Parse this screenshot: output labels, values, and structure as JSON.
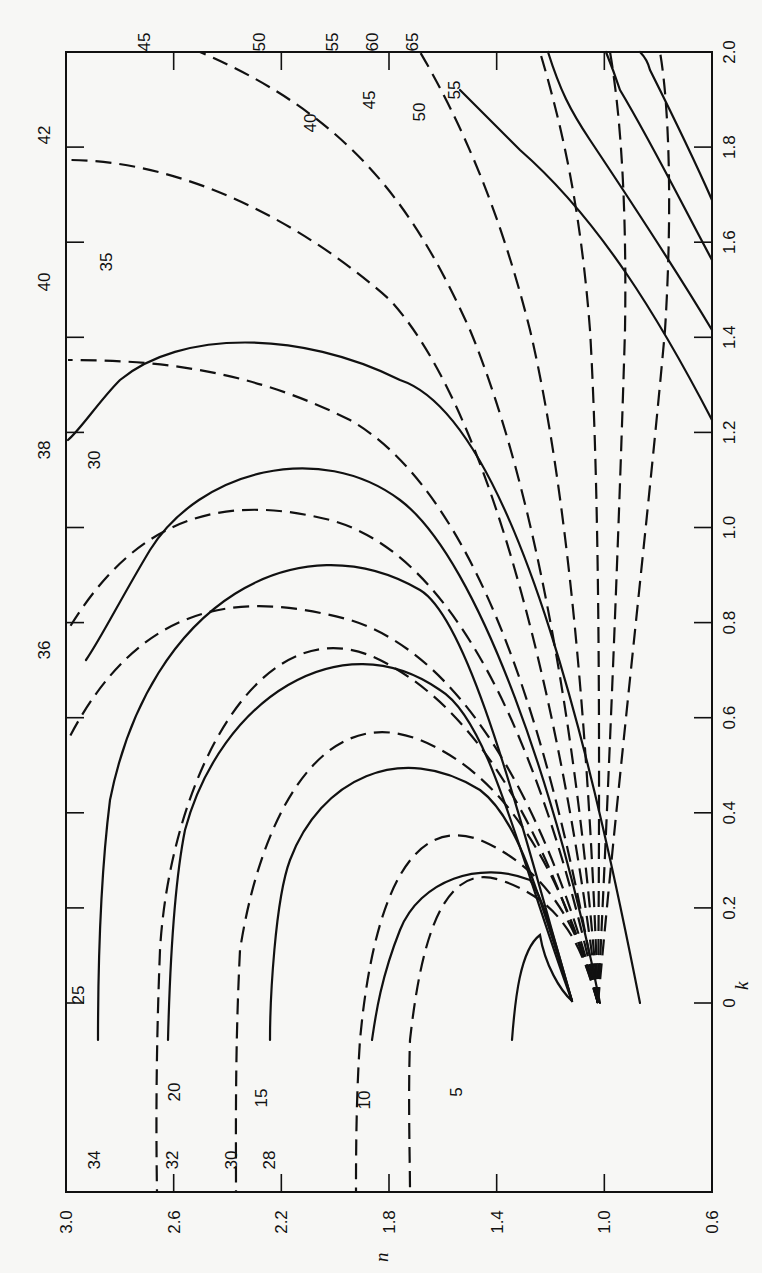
{
  "chart_data": {
    "type": "line",
    "orientation": "rotated 90 degrees (k axis runs vertically along the right edge, n axis horizontally along the bottom, labels printed sideways)",
    "title": "",
    "xlabel": "k",
    "ylabel": "n",
    "x_axis": {
      "name": "k",
      "range": [
        0,
        2.0
      ],
      "ticks": [
        "0",
        "0.2",
        "0.4",
        "0.6",
        "0.8",
        "1.0",
        "1.2",
        "1.4",
        "1.6",
        "1.8",
        "2.0"
      ]
    },
    "y_axis": {
      "name": "n",
      "range": [
        0.6,
        3.0
      ],
      "ticks": [
        "3.0",
        "2.6",
        "2.2",
        "1.8",
        "1.4",
        "1.0",
        "0.6"
      ]
    },
    "grid": false,
    "legend": "none (curves labeled inline)",
    "series": [
      {
        "name": "solid family",
        "style": "solid",
        "labels": [
          "5",
          "10",
          "15",
          "20",
          "25",
          "30",
          "35",
          "40",
          "45",
          "50",
          "55"
        ],
        "description": "Arcs rising from near (k=0.02, n=0.98) to a maximum k and descending toward low n",
        "arcs": [
          {
            "label": "5",
            "n_start": 1.48,
            "k_start": 0.13,
            "k_peak": 0.37,
            "n_peak": 1.26
          },
          {
            "label": "10",
            "n_start": 1.84,
            "k_start": 0.13,
            "k_peak": 0.6,
            "n_peak": 1.36
          },
          {
            "label": "15",
            "n_start": 2.2,
            "k_start": 0.13,
            "k_peak": 0.83,
            "n_peak": 1.48
          },
          {
            "label": "20",
            "n_start": 2.55,
            "k_start": 0.13,
            "k_peak": 1.04,
            "n_peak": 1.62
          },
          {
            "label": "25",
            "n_start": 2.94,
            "k_start": 0.13,
            "k_peak": 1.27,
            "n_peak": 1.75
          },
          {
            "label": "30",
            "n_start": 3.0,
            "k_start": 1.03,
            "k_peak": 1.52,
            "n_peak": 1.94
          },
          {
            "label": "35",
            "n_start": 3.0,
            "k_start": 1.57,
            "k_peak": 1.79,
            "n_peak": 2.17
          },
          {
            "label": "40",
            "n_start": 1.96,
            "k_start": 2.0,
            "k_peak": 2.0,
            "n_peak": 1.96
          },
          {
            "label": "45",
            "n_start": 1.72,
            "k_start": 2.0,
            "k_peak": 2.0,
            "n_peak": 1.72
          },
          {
            "label": "50",
            "n_start": 1.45,
            "k_start": 2.0,
            "k_peak": 2.0,
            "n_peak": 1.45
          },
          {
            "label": "55",
            "n_start": 1.3,
            "k_start": 2.0,
            "k_peak": 2.0,
            "n_peak": 1.3
          }
        ]
      },
      {
        "name": "dashed family",
        "style": "dashed",
        "labels": [
          "28",
          "30",
          "32",
          "34",
          "36",
          "38",
          "40",
          "42",
          "45",
          "50",
          "55",
          "60",
          "65"
        ],
        "description": "Arcs rising from near (k=0, n=0.76) toward upper-left edge",
        "arcs": [
          {
            "label": "28",
            "n_start": 1.72,
            "k_start": -0.14
          },
          {
            "label": "30",
            "n_start": 1.87,
            "k_start": -0.14
          },
          {
            "label": "32",
            "n_start": 2.2,
            "k_start": -0.14
          },
          {
            "label": "34",
            "n_start": 2.65,
            "k_start": -0.14
          },
          {
            "label": "36",
            "n_start": 3.0,
            "k_start": 0.56
          },
          {
            "label": "38",
            "n_start": 3.0,
            "k_start": 1.02
          },
          {
            "label": "40",
            "n_start": 3.0,
            "k_start": 1.42
          },
          {
            "label": "42",
            "n_start": 3.0,
            "k_start": 1.77
          },
          {
            "label": "45",
            "n_start": 2.6,
            "k_start": 2.0
          },
          {
            "label": "50",
            "n_start": 1.96,
            "k_start": 2.0
          },
          {
            "label": "55",
            "n_start": 1.58,
            "k_start": 2.0
          },
          {
            "label": "60",
            "n_start": 1.35,
            "k_start": 2.0
          },
          {
            "label": "65",
            "n_start": 1.12,
            "k_start": 2.0
          }
        ]
      }
    ],
    "annotations": {
      "top_edge_labels": [
        "45",
        "50",
        "55",
        "60",
        "65"
      ],
      "left_edge_labels": [
        "42",
        "40",
        "38",
        "36"
      ],
      "bottom_edge_labels": [
        "34",
        "32",
        "30",
        "28"
      ],
      "interior_labels": [
        "25",
        "20",
        "15",
        "10",
        "5",
        "30",
        "35",
        "40",
        "45",
        "50",
        "55"
      ]
    }
  },
  "axes": {
    "k_label": "k",
    "n_label": "n",
    "k_ticks": [
      "0",
      "0.2",
      "0.4",
      "0.6",
      "0.8",
      "1.0",
      "1.2",
      "1.4",
      "1.6",
      "1.8",
      "2.0"
    ],
    "n_ticks": [
      "3.0",
      "2.6",
      "2.2",
      "1.8",
      "1.4",
      "1.0",
      "0.6"
    ]
  }
}
